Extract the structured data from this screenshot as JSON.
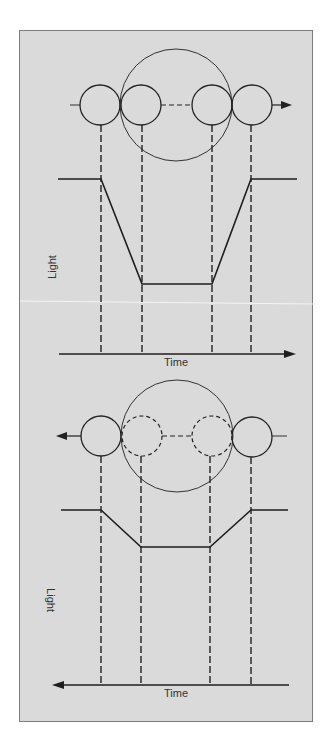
{
  "figure": {
    "panel_background": "#dadada",
    "panel_border": "#7c7c7c",
    "ink_color": "#222222",
    "top_diagram": {
      "description": "Small body transits across large star, moving left to right; light curve shows deep dip",
      "direction": "right",
      "y_axis_label": "Light",
      "x_axis_label": "Time",
      "small_circle_style": "solid",
      "contact_points": [
        "first contact",
        "second contact",
        "third contact",
        "fourth contact"
      ]
    },
    "bottom_diagram": {
      "description": "Body passes behind larger star (occultation), moving right to left; light curve shows shallow dip",
      "direction": "left",
      "y_axis_label": "Light",
      "x_axis_label": "Time",
      "small_circle_style": "dashed-when-hidden",
      "contact_points": [
        "first contact",
        "second contact",
        "third contact",
        "fourth contact"
      ]
    }
  }
}
